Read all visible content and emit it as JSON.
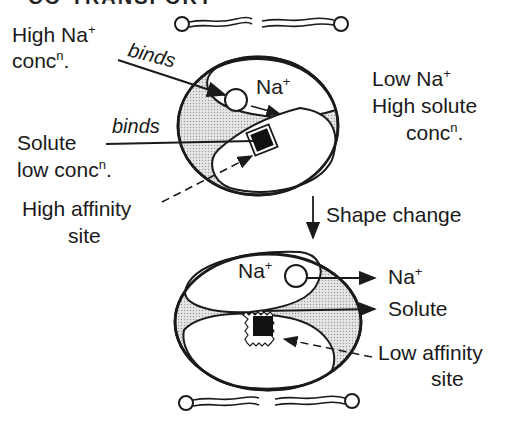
{
  "title_fragment": "CO-TRANSPORT",
  "top_state": {
    "left_labels": {
      "high_na": "High Na",
      "high_na_sup": "+",
      "high_na_conc": "conc",
      "high_na_conc_sup": "n",
      "high_na_conc_tail": ".",
      "binds_1": "binds",
      "binds_2": "binds",
      "solute": "Solute",
      "solute_low": "low conc",
      "solute_low_sup": "n",
      "solute_low_tail": ".",
      "high_affinity_1": "High affinity",
      "high_affinity_2": "site"
    },
    "inner_na": "Na",
    "inner_na_sup": "+",
    "right_labels": {
      "low_na": "Low Na",
      "low_na_sup": "+",
      "high_solute": "High solute",
      "conc": "conc",
      "conc_sup": "n",
      "conc_tail": "."
    }
  },
  "transition": {
    "label": "Shape change"
  },
  "bottom_state": {
    "inner_na": "Na",
    "inner_na_sup": "+",
    "out_na": "Na",
    "out_na_sup": "+",
    "out_solute": "Solute",
    "low_affinity_1": "Low affinity",
    "low_affinity_2": "site"
  },
  "colors": {
    "ink": "#1a1a1a",
    "shade": "#d9d9d9",
    "background": "#ffffff"
  }
}
